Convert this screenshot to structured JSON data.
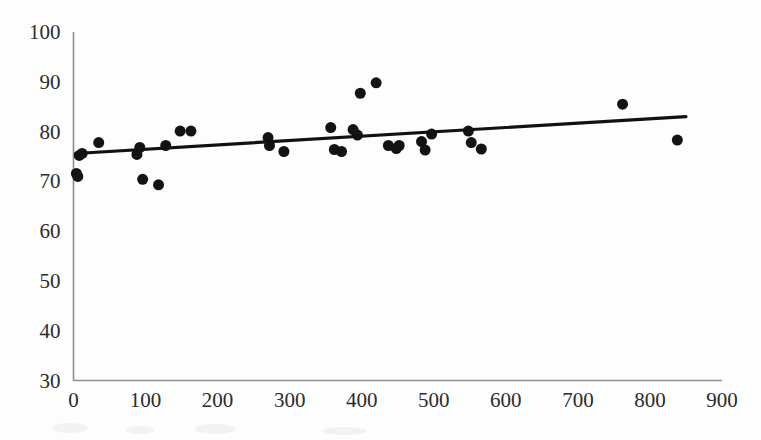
{
  "chart_data": {
    "type": "scatter",
    "title": "",
    "subtitle": "",
    "xlabel": "",
    "ylabel": "",
    "xlim": [
      0,
      900
    ],
    "ylim": [
      30,
      100
    ],
    "xticks": [
      0,
      100,
      200,
      300,
      400,
      500,
      600,
      700,
      800,
      900
    ],
    "yticks": [
      30,
      40,
      50,
      60,
      70,
      80,
      90,
      100
    ],
    "xtick_labels": [
      "0",
      "100",
      "200",
      "300",
      "400",
      "500",
      "600",
      "700",
      "800",
      "900"
    ],
    "ytick_labels": [
      "30",
      "40",
      "50",
      "60",
      "70",
      "80",
      "90",
      "100"
    ],
    "grid": false,
    "legend": null,
    "legend_position": "none",
    "marker": "filled-circle",
    "marker_color": "#131313",
    "marker_size": 11,
    "series": [
      {
        "name": "observations",
        "points": [
          [
            4,
            71.6
          ],
          [
            6,
            71.0
          ],
          [
            8,
            75.2
          ],
          [
            12,
            75.6
          ],
          [
            35,
            77.8
          ],
          [
            88,
            75.4
          ],
          [
            92,
            76.8
          ],
          [
            96,
            70.4
          ],
          [
            118,
            69.3
          ],
          [
            128,
            77.2
          ],
          [
            148,
            80.1
          ],
          [
            163,
            80.1
          ],
          [
            270,
            78.8
          ],
          [
            272,
            77.2
          ],
          [
            292,
            76.0
          ],
          [
            357,
            80.8
          ],
          [
            362,
            76.4
          ],
          [
            372,
            76.0
          ],
          [
            388,
            80.4
          ],
          [
            394,
            79.3
          ],
          [
            398,
            87.7
          ],
          [
            420,
            89.8
          ],
          [
            437,
            77.2
          ],
          [
            448,
            76.6
          ],
          [
            452,
            77.2
          ],
          [
            483,
            78.0
          ],
          [
            488,
            76.3
          ],
          [
            497,
            79.5
          ],
          [
            548,
            80.1
          ],
          [
            552,
            77.8
          ],
          [
            566,
            76.5
          ],
          [
            762,
            85.5
          ],
          [
            838,
            78.3
          ]
        ]
      }
    ],
    "trend_line": {
      "type": "linear-fit",
      "x_start": 3,
      "y_start": 75.6,
      "x_end": 850,
      "y_end": 83.0,
      "color": "#111111"
    }
  }
}
